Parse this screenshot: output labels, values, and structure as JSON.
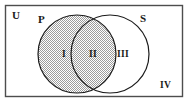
{
  "figure": {
    "type": "venn-diagram",
    "width": 190,
    "height": 102,
    "background_color": "#ffffff"
  },
  "universe": {
    "label": "U",
    "border_color": "#4d4d4d",
    "fill_color": "#ffffff"
  },
  "sets": [
    {
      "id": "P",
      "label": "P",
      "shaded": true,
      "outline_color": "#1a1a1a",
      "fill_color": "#d9d9d9"
    },
    {
      "id": "S",
      "label": "S",
      "shaded": false,
      "outline_color": "#1a1a1a",
      "fill_color": "#ffffff"
    }
  ],
  "regions": [
    {
      "id": "I",
      "label": "I",
      "description": "P only",
      "shaded": true
    },
    {
      "id": "II",
      "label": "II",
      "description": "P and S",
      "shaded": true
    },
    {
      "id": "III",
      "label": "III",
      "description": "S only",
      "shaded": false
    },
    {
      "id": "IV",
      "label": "IV",
      "description": "outside P and S",
      "shaded": false
    }
  ],
  "geometry": {
    "rect": {
      "x": 5,
      "y": 5,
      "width": 178,
      "height": 92
    },
    "circle_p": {
      "cx": 77,
      "cy": 54,
      "r": 39
    },
    "circle_s": {
      "cx": 110,
      "cy": 54,
      "r": 39
    }
  }
}
